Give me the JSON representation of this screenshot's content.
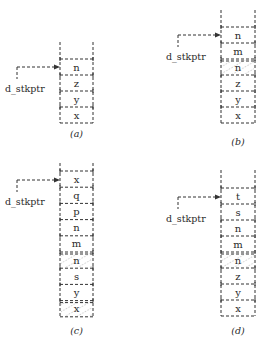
{
  "diagram": {
    "pointer_label": "d_stkptr",
    "panels": [
      {
        "id": "a",
        "caption": "(a)",
        "x": 60,
        "w": 33,
        "top": 42,
        "first_divider": 59,
        "cell_h": 16,
        "pointer_y": 67,
        "pointer_x0": 17,
        "pointer_label_y": 92,
        "cells": [
          {
            "label": "n",
            "hatched": false
          },
          {
            "label": "z",
            "hatched": false
          },
          {
            "label": "y",
            "hatched": false
          },
          {
            "label": "x",
            "hatched": false
          }
        ],
        "caption_y": 137
      },
      {
        "id": "b",
        "caption": "(b)",
        "x": 221,
        "w": 34,
        "top": 10,
        "first_divider": 27,
        "cell_h": 16,
        "pointer_y": 35,
        "pointer_x0": 178,
        "pointer_label_y": 60,
        "cells": [
          {
            "label": "n",
            "hatched": false
          },
          {
            "label": "m",
            "hatched": false
          },
          {
            "label": "n",
            "hatched": true
          },
          {
            "label": "z",
            "hatched": false
          },
          {
            "label": "y",
            "hatched": false
          },
          {
            "label": "x",
            "hatched": false
          }
        ],
        "caption_y": 145
      },
      {
        "id": "c",
        "caption": "(c)",
        "x": 60,
        "w": 33,
        "top": 163,
        "first_divider": 171,
        "cell_h": 16.2,
        "pointer_y": 180,
        "pointer_x0": 17,
        "pointer_label_y": 205,
        "cells": [
          {
            "label": "x",
            "hatched": false
          },
          {
            "label": "q",
            "hatched": false
          },
          {
            "label": "p",
            "hatched": false
          },
          {
            "label": "n",
            "hatched": false
          },
          {
            "label": "m",
            "hatched": false
          },
          {
            "label": "n",
            "hatched": true
          },
          {
            "label": "s",
            "hatched": false
          },
          {
            "label": "y",
            "hatched": false
          },
          {
            "label": "x",
            "hatched": true
          }
        ],
        "caption_y": 334
      },
      {
        "id": "d",
        "caption": "(d)",
        "x": 221,
        "w": 34,
        "top": 170,
        "first_divider": 188,
        "cell_h": 16,
        "pointer_y": 197,
        "pointer_x0": 178,
        "pointer_label_y": 222,
        "cells": [
          {
            "label": "t",
            "hatched": false
          },
          {
            "label": "s",
            "hatched": false
          },
          {
            "label": "n",
            "hatched": false
          },
          {
            "label": "m",
            "hatched": false
          },
          {
            "label": "n",
            "hatched": true
          },
          {
            "label": "z",
            "hatched": false
          },
          {
            "label": "y",
            "hatched": false
          },
          {
            "label": "x",
            "hatched": false
          }
        ],
        "caption_y": 334
      }
    ]
  }
}
